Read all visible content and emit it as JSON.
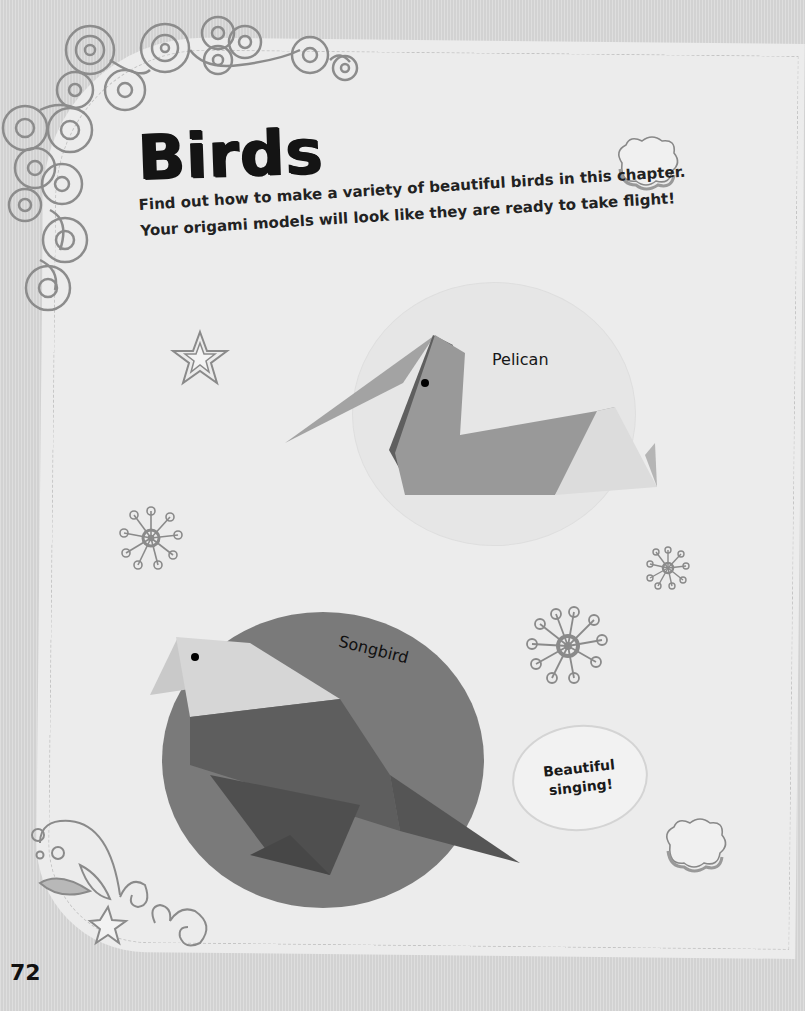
{
  "page": {
    "title": "Birds",
    "intro": "Find out how to make a variety of beautiful birds in this chapter. Your origami models will look like they are ready to take flight!",
    "page_number": "72"
  },
  "models": [
    {
      "name": "Pelican",
      "label": "Pelican"
    },
    {
      "name": "Songbird",
      "label": "Songbird"
    }
  ],
  "callout": {
    "text": "Beautiful singing!"
  },
  "decorations": [
    "swirl-border-icon",
    "cloud-icon",
    "star-icon",
    "flower-icon",
    "flower-icon",
    "flower-icon",
    "cloud-icon",
    "shooting-star-swirl-icon"
  ],
  "colors": {
    "background": "#d9d9d9",
    "panel": "#ececec",
    "pelican_paper": "#9a9a9a",
    "songbird_circle": "#7a7a7a",
    "songbird_body": "#5e5e5e",
    "songbird_head": "#d6d6d6",
    "ink": "#141414"
  }
}
